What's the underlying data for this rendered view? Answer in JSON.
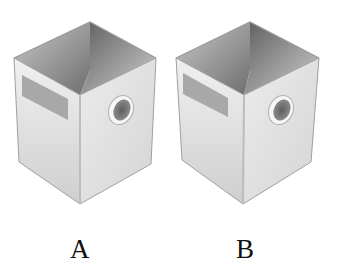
{
  "figure": {
    "panels": [
      {
        "label": "A",
        "description": "open-top box with label rectangle and circular hole"
      },
      {
        "label": "B",
        "description": "open-top box with label rectangle and circular hole"
      }
    ]
  },
  "colors": {
    "background": "#ffffff",
    "box_face_light": "#e9e9e9",
    "box_face_mid": "#d6d6d6",
    "interior_dark": "#7a7a7a",
    "label_rect": "#a9a9a9",
    "hole": "#6f6f6f",
    "edge": "#9a9a9a",
    "text": "#111111"
  }
}
